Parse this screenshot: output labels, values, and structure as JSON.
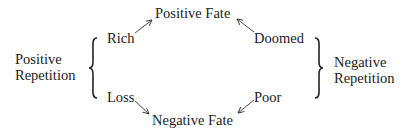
{
  "diagram": {
    "nodes": {
      "positive_fate": "Positive Fate",
      "negative_fate": "Negative Fate",
      "rich": "Rich",
      "doomed": "Doomed",
      "loss": "Loss",
      "poor": "Poor"
    },
    "groups": {
      "positive_repetition": {
        "line1": "Positive",
        "line2": "Repetition"
      },
      "negative_repetition": {
        "line1": "Negative",
        "line2": "Repetition"
      }
    },
    "edges": [
      {
        "from": "Rich",
        "to": "Positive Fate"
      },
      {
        "from": "Doomed",
        "to": "Positive Fate"
      },
      {
        "from": "Loss",
        "to": "Negative Fate"
      },
      {
        "from": "Poor",
        "to": "Negative Fate"
      }
    ],
    "braces": [
      {
        "label": "Positive Repetition",
        "groups": [
          "Rich",
          "Loss"
        ]
      },
      {
        "label": "Negative Repetition",
        "groups": [
          "Doomed",
          "Poor"
        ]
      }
    ]
  }
}
